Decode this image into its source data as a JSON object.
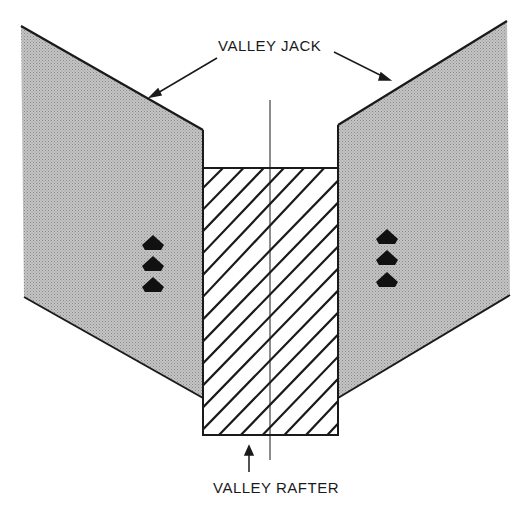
{
  "diagram": {
    "type": "roof framing detail",
    "labels": {
      "valley_jack": "VALLEY JACK",
      "valley_rafter": "VALLEY RAFTER"
    },
    "components": [
      {
        "name": "left valley jack",
        "fill": "stippled gray"
      },
      {
        "name": "right valley jack",
        "fill": "stippled gray"
      },
      {
        "name": "valley rafter",
        "fill": "diagonal hatch"
      }
    ],
    "nails": {
      "left_count": 3,
      "right_count": 3
    },
    "colors": {
      "line": "#1a1a1a",
      "jack_fill": "#bdbdbd",
      "background": "#ffffff"
    }
  }
}
